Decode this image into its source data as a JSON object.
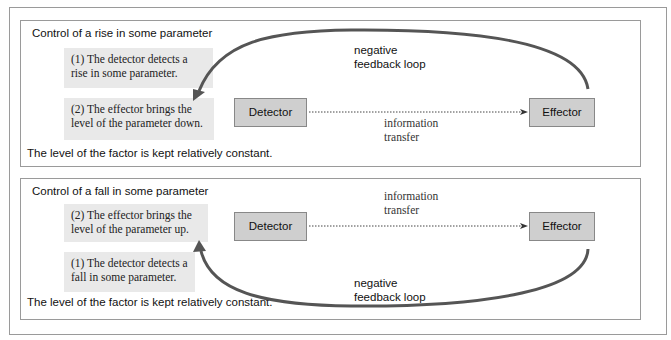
{
  "panels": [
    {
      "title": "Control of a rise in some parameter",
      "step1": "(1) The detector detects a rise in some parameter.",
      "step2": "(2) The effector brings the level of the parameter down.",
      "detector": "Detector",
      "effector": "Effector",
      "transfer_label_1": "information",
      "transfer_label_2": "transfer",
      "loop_label_1": "negative",
      "loop_label_2": "feedback loop",
      "footer": "The level of the factor is kept relatively constant."
    },
    {
      "title": "Control of a fall in some parameter",
      "step2": "(2) The effector brings the level of the parameter up.",
      "step1": "(1) The detector detects a fall in some parameter.",
      "detector": "Detector",
      "effector": "Effector",
      "transfer_label_1": "information",
      "transfer_label_2": "transfer",
      "loop_label_1": "negative",
      "loop_label_2": "feedback loop",
      "footer": "The level of the factor is kept relatively constant."
    }
  ],
  "colors": {
    "box_fill": "#cfcfcf",
    "note_fill": "#e9e9e9",
    "arrow": "#555555"
  }
}
